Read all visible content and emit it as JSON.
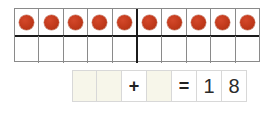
{
  "worksheet": {
    "ten_frame": {
      "label": "ten-frame",
      "columns": 10,
      "rows": 2,
      "major_divider_after_column": 5,
      "dot_color": "#c0391b",
      "top_row": [
        {
          "filled": true
        },
        {
          "filled": true
        },
        {
          "filled": true
        },
        {
          "filled": true
        },
        {
          "filled": true
        },
        {
          "filled": true
        },
        {
          "filled": true
        },
        {
          "filled": true
        },
        {
          "filled": true
        },
        {
          "filled": true
        }
      ],
      "bottom_row": [
        {
          "filled": false
        },
        {
          "filled": false
        },
        {
          "filled": false
        },
        {
          "filled": false
        },
        {
          "filled": false
        },
        {
          "filled": false
        },
        {
          "filled": false
        },
        {
          "filled": false
        },
        {
          "filled": false
        },
        {
          "filled": false
        }
      ],
      "dot_count": 10
    },
    "equation": {
      "label": "addition-equation",
      "cells": [
        {
          "type": "blank",
          "text": ""
        },
        {
          "type": "blank",
          "text": ""
        },
        {
          "type": "operator",
          "text": "+"
        },
        {
          "type": "blank",
          "text": ""
        },
        {
          "type": "operator",
          "text": "="
        },
        {
          "type": "digit",
          "text": "1"
        },
        {
          "type": "digit",
          "text": "8"
        }
      ],
      "answer_text": "18"
    }
  }
}
